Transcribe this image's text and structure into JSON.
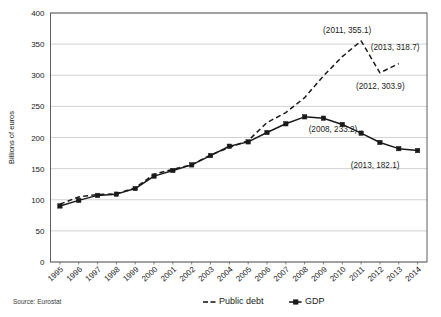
{
  "chart": {
    "type": "line",
    "ylabel": "Billions of euros",
    "xlabel": "",
    "title": "",
    "source": "Source: Eurostat"
  },
  "legend": {
    "position": "bottom",
    "items": [
      {
        "label": "Public debt",
        "style": "dashed",
        "marker": "none",
        "color": "#1a1a1a"
      },
      {
        "label": "GDP",
        "style": "solid",
        "marker": "square",
        "color": "#1a1a1a"
      }
    ]
  },
  "chart_data": {
    "type": "line",
    "title": "",
    "xlabel": "",
    "ylabel": "Billions of euros",
    "ylim": [
      0,
      400
    ],
    "ytick_step": 50,
    "yticks": [
      "0",
      "50",
      "100",
      "150",
      "200",
      "250",
      "300",
      "350",
      "400"
    ],
    "grid": true,
    "legend_position": "bottom",
    "categories": [
      "1995",
      "1996",
      "1997",
      "1998",
      "1999",
      "2000",
      "2001",
      "2002",
      "2003",
      "2004",
      "2005",
      "2006",
      "2007",
      "2008",
      "2009",
      "2010",
      "2011",
      "2012",
      "2013",
      "2014"
    ],
    "series": [
      {
        "name": "Public debt",
        "style": "dashed",
        "values": [
          93.0,
          104.5,
          108.5,
          109.5,
          119.0,
          141.0,
          149.0,
          156.0,
          172.0,
          184.0,
          195.0,
          224.0,
          240.0,
          264.0,
          299.0,
          330.0,
          355.1,
          303.9,
          318.7,
          null
        ]
      },
      {
        "name": "GDP",
        "style": "solid",
        "values": [
          90.0,
          99.0,
          107.0,
          109.0,
          118.0,
          138.0,
          147.0,
          156.0,
          171.0,
          186.0,
          193.0,
          208.0,
          222.0,
          233.2,
          231.0,
          221.0,
          207.0,
          192.0,
          182.1,
          179.0
        ]
      }
    ],
    "annotations": [
      {
        "text": "(2011, 355.1)",
        "series": "Public debt",
        "x": "2011",
        "y": 355.1
      },
      {
        "text": "(2013, 318.7)",
        "series": "Public debt",
        "x": "2013",
        "y": 318.7
      },
      {
        "text": "(2012, 303.9)",
        "series": "Public debt",
        "x": "2012",
        "y": 303.9
      },
      {
        "text": "(2008, 233.2)",
        "series": "GDP",
        "x": "2008",
        "y": 233.2
      },
      {
        "text": "(2013, 182.1)",
        "series": "GDP",
        "x": "2013",
        "y": 182.1
      }
    ]
  }
}
